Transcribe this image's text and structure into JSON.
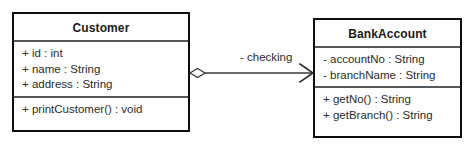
{
  "diagram": {
    "type": "uml-class-diagram",
    "background_color": "#ffffff",
    "border_color": "#0d0d0d",
    "divider_color": "#55595c",
    "connector_color": "#3a3a3a",
    "classes": [
      {
        "id": "customer",
        "name": "Customer",
        "attributes": [
          "+ id : int",
          "+ name : String",
          "+ address : String"
        ],
        "operations": [
          "+ printCustomer() : void"
        ]
      },
      {
        "id": "bankaccount",
        "name": "BankAccount",
        "attributes": [
          "- accountNo : String",
          "- branchName : String"
        ],
        "operations": [
          "+ getNo() : String",
          "+ getBranch() : String"
        ]
      }
    ],
    "relationship": {
      "kind": "aggregation",
      "source": "Customer",
      "target": "BankAccount",
      "label": "- checking",
      "source_decoration": "open-diamond",
      "target_decoration": "open-arrowhead"
    }
  }
}
